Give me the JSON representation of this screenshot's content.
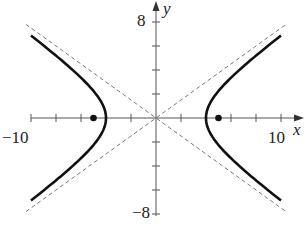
{
  "chart_data": {
    "type": "line",
    "title": "",
    "xlabel": "x",
    "ylabel": "y",
    "xlim": [
      -10,
      10
    ],
    "ylim": [
      -8,
      8
    ],
    "x_tick_labels": [
      "-10",
      "10"
    ],
    "y_tick_labels": [
      "8",
      "-8"
    ],
    "x_tick_step": 2,
    "y_tick_step": 2,
    "grid": false,
    "series": [
      {
        "name": "hyperbola",
        "style": "solid",
        "a": 4,
        "b": 3
      },
      {
        "name": "asymptotes",
        "style": "dashed",
        "slopes": [
          0.75,
          -0.75
        ]
      }
    ],
    "points": [
      {
        "name": "focus-left",
        "x": -5,
        "y": 0
      },
      {
        "name": "focus-right",
        "x": 5,
        "y": 0
      }
    ]
  },
  "labels": {
    "x_axis": "x",
    "y_axis": "y",
    "x_min": "−10",
    "x_max": "10",
    "y_max": "8",
    "y_min": "−8"
  }
}
